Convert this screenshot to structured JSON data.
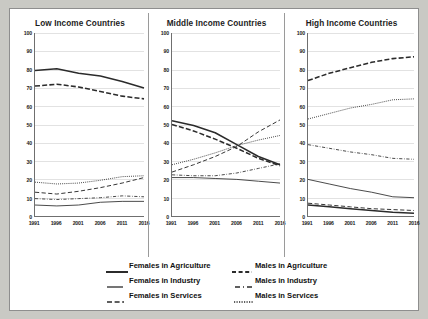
{
  "chart_data": {
    "type": "line",
    "title": "",
    "panels": [
      {
        "title": "Low Income Countries",
        "xlabel": "",
        "ylabel": "",
        "x": [
          1991,
          1996,
          2001,
          2006,
          2011,
          2016
        ],
        "xlim": [
          1991,
          2016
        ],
        "ylim": [
          0,
          100
        ],
        "yticks": [
          0,
          10,
          20,
          30,
          40,
          50,
          60,
          70,
          80,
          90,
          100
        ],
        "grid": true,
        "series": [
          {
            "name": "Females in Agriculture",
            "values": [
              79.5,
              80.5,
              78.0,
              76.5,
              73.5,
              70.0
            ]
          },
          {
            "name": "Males in Agriculture",
            "values": [
              71.0,
              72.0,
              70.5,
              68.0,
              65.5,
              64.0
            ]
          },
          {
            "name": "Females in Industry",
            "values": [
              6.0,
              5.5,
              6.0,
              7.5,
              8.0,
              8.0
            ]
          },
          {
            "name": "Males in Industry",
            "values": [
              9.5,
              9.0,
              9.5,
              10.0,
              11.0,
              10.5
            ]
          },
          {
            "name": "Females in Services",
            "values": [
              13.0,
              12.0,
              13.5,
              15.5,
              18.0,
              21.0
            ]
          },
          {
            "name": "Males in Services",
            "values": [
              18.5,
              17.5,
              18.0,
              19.5,
              21.5,
              22.0
            ]
          }
        ]
      },
      {
        "title": "Middle Income Countries",
        "xlabel": "",
        "ylabel": "",
        "x": [
          1991,
          1996,
          2001,
          2006,
          2011,
          2016
        ],
        "xlim": [
          1991,
          2016
        ],
        "ylim": [
          0,
          100
        ],
        "yticks": [
          0,
          10,
          20,
          30,
          40,
          50,
          60,
          70,
          80,
          90,
          100
        ],
        "grid": true,
        "series": [
          {
            "name": "Females in Agriculture",
            "values": [
              52.0,
              49.5,
              45.5,
              39.0,
              32.5,
              28.0
            ]
          },
          {
            "name": "Males in Agriculture",
            "values": [
              50.0,
              46.5,
              42.0,
              37.0,
              31.5,
              27.5
            ]
          },
          {
            "name": "Females in Industry",
            "values": [
              21.0,
              21.0,
              20.5,
              20.0,
              19.0,
              18.0
            ]
          },
          {
            "name": "Males in Industry",
            "values": [
              22.5,
              22.0,
              22.0,
              23.5,
              26.0,
              28.5
            ]
          },
          {
            "name": "Females in Services",
            "values": [
              24.0,
              28.0,
              32.5,
              38.0,
              46.0,
              52.5
            ]
          },
          {
            "name": "Males in Services",
            "values": [
              28.0,
              31.0,
              34.5,
              38.5,
              41.5,
              44.0
            ]
          }
        ]
      },
      {
        "title": "High Income Countries",
        "xlabel": "",
        "ylabel": "",
        "x": [
          1991,
          1996,
          2001,
          2006,
          2011,
          2016
        ],
        "xlim": [
          1991,
          2016
        ],
        "ylim": [
          0,
          100
        ],
        "yticks": [
          0,
          10,
          20,
          30,
          40,
          50,
          60,
          70,
          80,
          90,
          100
        ],
        "grid": true,
        "series": [
          {
            "name": "Females in Agriculture",
            "values": [
              6.0,
              5.0,
              4.0,
              3.0,
              2.0,
              1.5
            ]
          },
          {
            "name": "Males in Agriculture",
            "values": [
              74.0,
              78.0,
              81.0,
              84.0,
              86.0,
              87.0
            ]
          },
          {
            "name": "Females in Industry",
            "values": [
              20.0,
              17.5,
              15.0,
              13.0,
              10.5,
              10.0
            ]
          },
          {
            "name": "Males in Industry",
            "values": [
              39.0,
              37.0,
              35.0,
              33.5,
              31.5,
              31.0
            ]
          },
          {
            "name": "Females in Services",
            "values": [
              7.0,
              6.0,
              5.0,
              4.0,
              3.5,
              3.0
            ]
          },
          {
            "name": "Males in Services",
            "values": [
              53.0,
              56.0,
              59.0,
              61.0,
              63.5,
              64.0
            ]
          }
        ]
      }
    ],
    "legend": {
      "position": "bottom",
      "entries": [
        {
          "label": "Females in Agriculture",
          "style": "solid-thick"
        },
        {
          "label": "Males in Agriculture",
          "style": "dashed-thick"
        },
        {
          "label": "Females in Industry",
          "style": "solid-thin"
        },
        {
          "label": "Males in Industry",
          "style": "dash-dot"
        },
        {
          "label": "Females  in Services",
          "style": "long-dash"
        },
        {
          "label": "Males in Services",
          "style": "dotted"
        }
      ]
    },
    "xticklabels": [
      "1991",
      "1996",
      "2001",
      "2006",
      "2011",
      "2016"
    ],
    "yticklabels": [
      "0",
      "10",
      "20",
      "30",
      "40",
      "50",
      "60",
      "70",
      "80",
      "90",
      "100"
    ],
    "colors": {
      "line": "#2b2b2b",
      "grid": "#e2e2e2",
      "axis": "#6f6f6f",
      "background": "#ffffff",
      "mat": "#c9c9c4"
    }
  }
}
